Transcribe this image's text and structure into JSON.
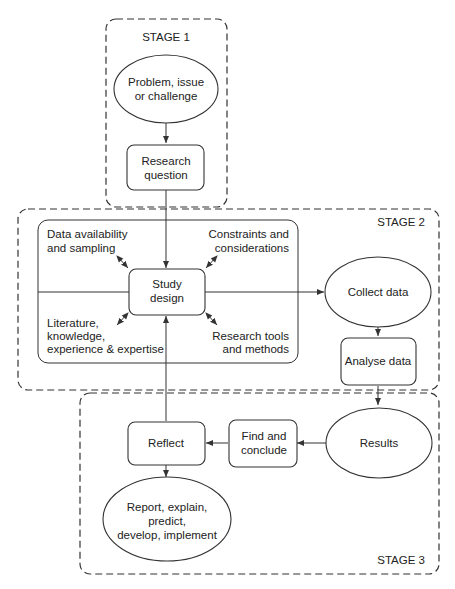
{
  "stages": {
    "stage1": "STAGE 1",
    "stage2": "STAGE 2",
    "stage3": "STAGE 3"
  },
  "nodes": {
    "problem": [
      "Problem, issue",
      "or challenge"
    ],
    "research_question": [
      "Research",
      "question"
    ],
    "study_design": [
      "Study",
      "design"
    ],
    "collect_data": [
      "Collect data"
    ],
    "analyse_data": [
      "Analyse data"
    ],
    "results": [
      "Results"
    ],
    "find_conclude": [
      "Find and",
      "conclude"
    ],
    "reflect": [
      "Reflect"
    ],
    "report": [
      "Report, explain,",
      "predict,",
      "develop, implement"
    ]
  },
  "considerations": {
    "data_availability": [
      "Data availability",
      "and sampling"
    ],
    "constraints": [
      "Constraints and",
      "considerations"
    ],
    "literature": [
      "Literature,",
      "knowledge,",
      "experience & expertise"
    ],
    "research_tools": [
      "Research tools",
      "and methods"
    ]
  },
  "colors": {
    "stroke": "#333333",
    "text": "#222222",
    "background": "#ffffff"
  }
}
